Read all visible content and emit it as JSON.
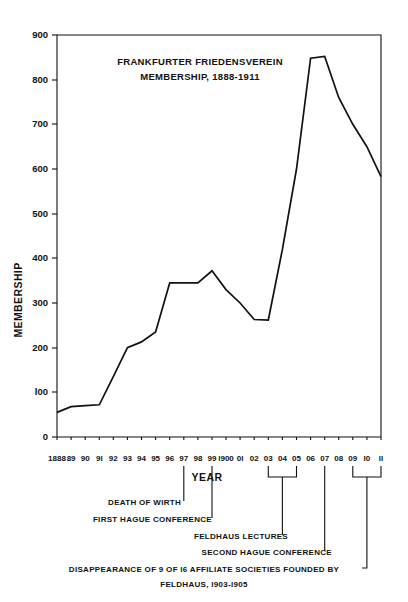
{
  "chart_data": {
    "type": "line",
    "title": "FRANKFURTER FRIEDENSVEREIN MEMBERSHIP, 1888-1911",
    "title_line1": "FRANKFURTER  FRIEDENSVEREIN",
    "title_line2": "MEMBERSHIP, 1888-1911",
    "xlabel": "YEAR",
    "ylabel": "MEMBERSHIP",
    "ylim": [
      0,
      900
    ],
    "yticks": [
      0,
      100,
      200,
      300,
      400,
      500,
      600,
      700,
      800,
      900
    ],
    "ytick_labels": [
      "0",
      "l00",
      "200",
      "300",
      "400",
      "500",
      "600",
      "700",
      "800",
      "900"
    ],
    "grid": false,
    "legend": "none",
    "categories": [
      "1888",
      "89",
      "90",
      "91",
      "92",
      "93",
      "94",
      "95",
      "96",
      "97",
      "98",
      "99",
      "1900",
      "01",
      "02",
      "03",
      "04",
      "05",
      "06",
      "07",
      "08",
      "09",
      "10",
      "11"
    ],
    "x": [
      1888,
      1889,
      1890,
      1891,
      1892,
      1893,
      1894,
      1895,
      1896,
      1897,
      1898,
      1899,
      1900,
      1901,
      1902,
      1903,
      1904,
      1905,
      1906,
      1907,
      1908,
      1909,
      1910,
      1911
    ],
    "values": [
      55,
      68,
      70,
      72,
      135,
      200,
      213,
      235,
      345,
      345,
      345,
      372,
      330,
      300,
      263,
      262,
      420,
      600,
      848,
      852,
      760,
      700,
      650,
      583
    ],
    "series": [
      {
        "name": "Membership",
        "values": [
          55,
          68,
          70,
          72,
          135,
          200,
          213,
          235,
          345,
          345,
          345,
          372,
          330,
          300,
          263,
          262,
          420,
          600,
          848,
          852,
          760,
          700,
          650,
          583
        ]
      }
    ],
    "annotations": [
      {
        "id": "death-of-wirth",
        "text": "DEATH OF WIRTH",
        "year": "97"
      },
      {
        "id": "first-hague-conference",
        "text": "FIRST  HAGUE  CONFERENCE",
        "year": "99"
      },
      {
        "id": "feldhaus-lectures",
        "text": "FELDHAUS  LECTURES",
        "year": "04"
      },
      {
        "id": "second-hague-conference",
        "text": "SECOND HAGUE CONFERENCE",
        "year": "07"
      },
      {
        "id": "disappearance-societies-line1",
        "text": "DISAPPEARANCE  OF  9  OF  l6  AFFILIATE  SOCIETIES  FOUNDED BY",
        "year": "09-11"
      },
      {
        "id": "disappearance-societies-line2",
        "text": "FELDHAUS, l903-l905",
        "year": "09-11"
      }
    ]
  },
  "xtick_labels": [
    "1888",
    "89",
    "90",
    "9l",
    "92",
    "93",
    "94",
    "95",
    "96",
    "97",
    "98",
    "99",
    "l900",
    "0l",
    "02",
    "03",
    "04",
    "05",
    "06",
    "07",
    "08",
    "09",
    "l0",
    "ll"
  ],
  "colors": {
    "ink": "#111111",
    "paper": "#ffffff"
  }
}
